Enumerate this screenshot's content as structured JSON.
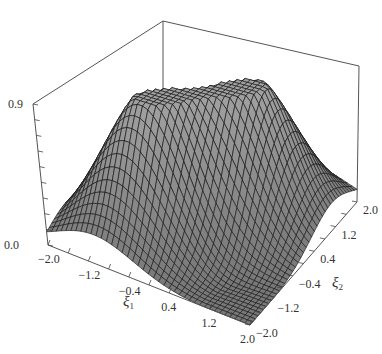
{
  "chart_data": {
    "type": "surface3d",
    "title": "",
    "xlabel": "ξ1",
    "ylabel": "ξ2",
    "zlabel": "",
    "x_ticks": [
      "-2.0",
      "-1.2",
      "-0.4",
      "0.4",
      "1.2",
      "2.0"
    ],
    "y_ticks": [
      "-2.0",
      "-1.2",
      "-0.4",
      "0.4",
      "1.2",
      "2.0"
    ],
    "z_ticks": [
      "0.0",
      "0.9"
    ],
    "xlim": [
      -2.0,
      2.0
    ],
    "ylim": [
      -2.0,
      2.0
    ],
    "zlim": [
      0.0,
      0.9
    ],
    "surface_description": "Two Gaussian-like peaks separated by a narrow valley along the diagonal; peak heights ~0.85-0.9",
    "peaks": [
      {
        "xi1": -0.6,
        "xi2": -0.6,
        "z": 0.88
      },
      {
        "xi1": 0.6,
        "xi2": 0.6,
        "z": 0.88
      }
    ],
    "grid_resolution": 40,
    "colors": {
      "surface_fill": "#8a8a8a",
      "mesh_line": "#111111",
      "box_line": "#555555",
      "background": "#ffffff"
    }
  },
  "axes": {
    "xi1": {
      "symbol": "ξ",
      "subscript": "1"
    },
    "xi2": {
      "symbol": "ξ",
      "subscript": "2"
    },
    "z_top": "0.9",
    "z_bottom": "0.0"
  }
}
